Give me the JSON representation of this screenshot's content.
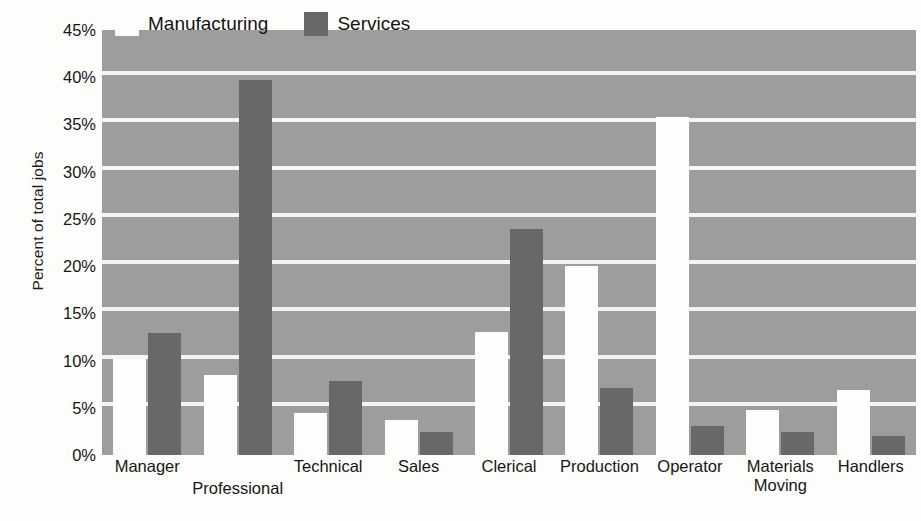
{
  "chart_data": {
    "type": "bar",
    "title": "",
    "subtitle": "",
    "xlabel": "",
    "ylabel": "Percent of total jobs",
    "ylim": [
      0,
      45
    ],
    "ytick_step": 5,
    "ytick_labels": [
      "0%",
      "5%",
      "10%",
      "15%",
      "20%",
      "25%",
      "30%",
      "35%",
      "40%",
      "45%"
    ],
    "ytick_values": [
      0,
      5,
      10,
      15,
      20,
      25,
      30,
      35,
      40,
      45
    ],
    "grid": "horizontal",
    "legend_position": "top-inside-left",
    "categories": [
      "Manager",
      "Professional",
      "Technical",
      "Sales",
      "Clerical",
      "Production",
      "Operator",
      "Materials\nMoving",
      "Handlers"
    ],
    "category_label_offset": [
      false,
      true,
      false,
      false,
      false,
      false,
      false,
      false,
      false
    ],
    "series": [
      {
        "name": "Manufacturing",
        "color": "#fdfdfb",
        "values": [
          10.2,
          8.5,
          4.5,
          3.7,
          13.0,
          20.0,
          35.8,
          4.8,
          6.9
        ]
      },
      {
        "name": "Services",
        "color": "#686868",
        "values": [
          12.9,
          39.7,
          7.8,
          2.4,
          23.9,
          7.1,
          3.1,
          2.4,
          2.0
        ]
      }
    ]
  },
  "legend": {
    "entries": [
      {
        "label": "Manufacturing",
        "swatch": "legend-swatch-manufacturing"
      },
      {
        "label": "Services",
        "swatch": "legend-swatch-services"
      }
    ]
  },
  "colors": {
    "plot_background": "#9d9d9d",
    "gridline": "#f4f4f2",
    "page_background": "#fdfdfc",
    "manufacturing_bar": "#fdfdfb",
    "services_bar": "#686868",
    "text": "#161616"
  }
}
